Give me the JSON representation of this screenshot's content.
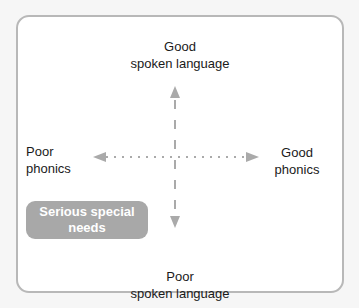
{
  "diagram": {
    "axes": {
      "vertical": {
        "top_label": [
          "Good",
          "spoken language"
        ],
        "bottom_label": [
          "Poor",
          "spoken language"
        ],
        "style": "dashed",
        "color": "#aaaaaa"
      },
      "horizontal": {
        "left_label": [
          "Poor",
          "phonics"
        ],
        "right_label": [
          "Good",
          "phonics"
        ],
        "style": "dotted",
        "color": "#aaaaaa"
      }
    },
    "badge": {
      "lines": [
        "Serious special",
        "needs"
      ],
      "background": "#a8a8a8",
      "text_color": "#ffffff"
    }
  }
}
